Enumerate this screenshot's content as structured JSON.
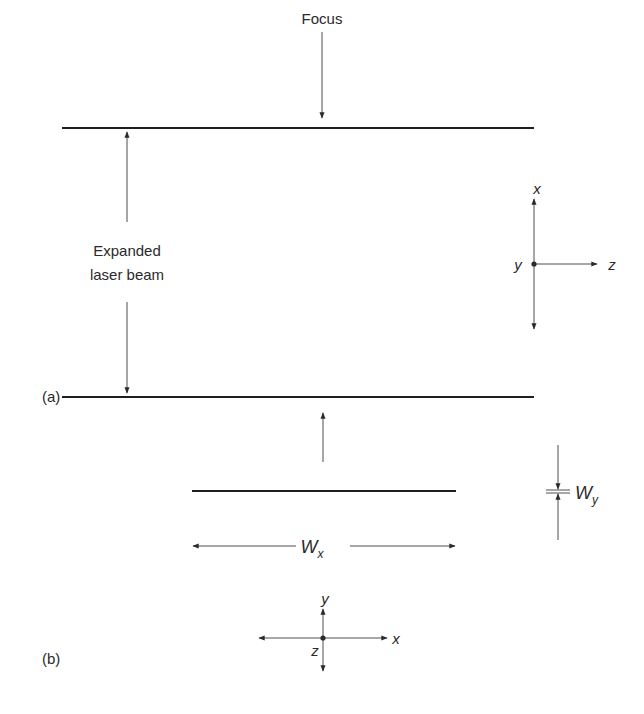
{
  "diagram": {
    "panel_a": {
      "label": "(a)",
      "focus_label": "Focus",
      "beam_label_line1": "Expanded",
      "beam_label_line2": "laser beam",
      "axes": {
        "up": "x",
        "center": "y",
        "right": "z"
      }
    },
    "panel_b": {
      "label": "(b)",
      "width_x_label": "W",
      "width_x_sub": "x",
      "width_y_label": "W",
      "width_y_sub": "y",
      "axes": {
        "up": "y",
        "center": "z",
        "right": "x"
      }
    },
    "colors": {
      "line": "#1e1e1e",
      "text": "#2a2a2a",
      "background": "#ffffff"
    }
  }
}
